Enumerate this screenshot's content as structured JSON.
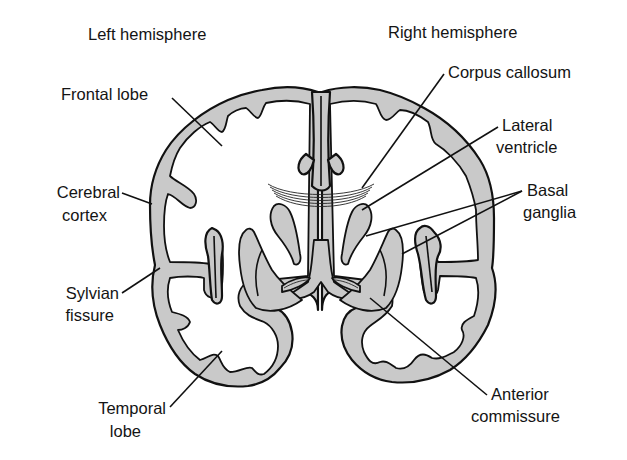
{
  "diagram": {
    "type": "anatomical-coronal-section",
    "colors": {
      "gray_matter": "#c9c9c9",
      "outline": "#111111",
      "background": "#ffffff"
    }
  },
  "headers": {
    "left": "Left hemisphere",
    "right": "Right hemisphere"
  },
  "labels": {
    "frontal_lobe": "Frontal lobe",
    "cerebral_cortex_1": "Cerebral",
    "cerebral_cortex_2": "cortex",
    "sylvian_fissure_1": "Sylvian",
    "sylvian_fissure_2": "fissure",
    "temporal_lobe_1": "Temporal",
    "temporal_lobe_2": "lobe",
    "corpus_callosum": "Corpus callosum",
    "lateral_ventricle_1": "Lateral",
    "lateral_ventricle_2": "ventricle",
    "basal_ganglia_1": "Basal",
    "basal_ganglia_2": "ganglia",
    "anterior_commissure_1": "Anterior",
    "anterior_commissure_2": "commissure"
  }
}
